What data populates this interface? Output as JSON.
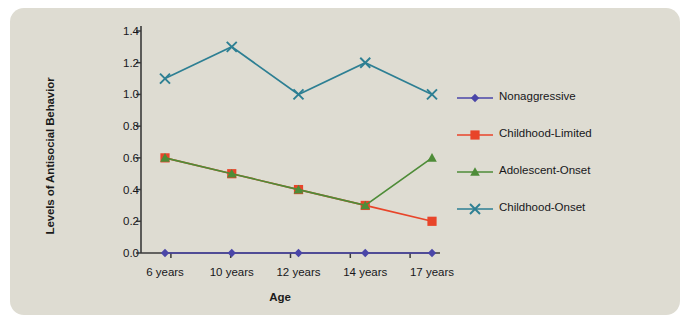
{
  "figure": {
    "background_color": "#dedcd2",
    "page_color": "#ffffff"
  },
  "chart_data": {
    "type": "line",
    "title": "",
    "xlabel": "Age",
    "ylabel": "Levels of Antisocial Behavior",
    "categories": [
      "6 years",
      "10 years",
      "12 years",
      "14 years",
      "17 years"
    ],
    "ylim": [
      0.0,
      1.4
    ],
    "yticks": [
      "0.0",
      "0.2",
      "0.4",
      "0.6",
      "0.8",
      "1.0",
      "1.2",
      "1.4"
    ],
    "ytick_values": [
      0.0,
      0.2,
      0.4,
      0.6,
      0.8,
      1.0,
      1.2,
      1.4
    ],
    "grid": false,
    "legend_position": "right",
    "series": [
      {
        "name": "Nonaggressive",
        "color": "#4a46a8",
        "marker": "diamond",
        "values": [
          0.0,
          0.0,
          0.0,
          0.0,
          0.0
        ]
      },
      {
        "name": "Childhood-Limited",
        "color": "#e8452a",
        "marker": "square",
        "values": [
          0.6,
          0.5,
          0.4,
          0.3,
          0.2
        ]
      },
      {
        "name": "Adolescent-Onset",
        "color": "#4e8c38",
        "marker": "triangle",
        "values": [
          0.6,
          0.5,
          0.4,
          0.3,
          0.6
        ]
      },
      {
        "name": "Childhood-Onset",
        "color": "#2d7f93",
        "marker": "cross",
        "values": [
          1.1,
          1.3,
          1.0,
          1.2,
          1.0
        ]
      }
    ]
  }
}
